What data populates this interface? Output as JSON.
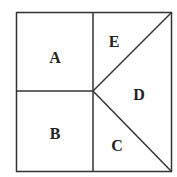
{
  "diagram": {
    "stroke_color": "#333333",
    "regions": [
      {
        "id": "A",
        "label": "A",
        "x": 55,
        "y": 63
      },
      {
        "id": "B",
        "label": "B",
        "x": 55,
        "y": 139
      },
      {
        "id": "C",
        "label": "C",
        "x": 117,
        "y": 151
      },
      {
        "id": "D",
        "label": "D",
        "x": 139,
        "y": 100
      },
      {
        "id": "E",
        "label": "E",
        "x": 114,
        "y": 47
      }
    ]
  }
}
